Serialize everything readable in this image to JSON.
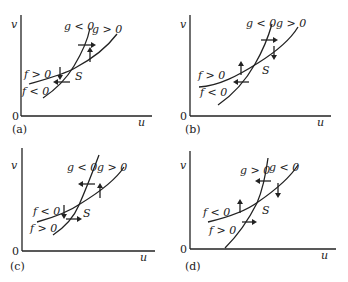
{
  "figure": {
    "panels": [
      {
        "id": "a",
        "caption": "(a)",
        "axis_x": "u",
        "axis_y": "v",
        "origin": "0",
        "f_upper": "f > 0",
        "f_lower": "f < 0",
        "g_left": "g < 0",
        "g_right": "g > 0",
        "point": "S"
      },
      {
        "id": "b",
        "caption": "(b)",
        "axis_x": "u",
        "axis_y": "v",
        "origin": "0",
        "f_upper": "f > 0",
        "f_lower": "f < 0",
        "g_left": "g < 0",
        "g_right": "g > 0",
        "point": "S"
      },
      {
        "id": "c",
        "caption": "(c)",
        "axis_x": "u",
        "axis_y": "v",
        "origin": "0",
        "f_upper": "f < 0",
        "f_lower": "f > 0",
        "g_left": "g < 0",
        "g_right": "g > 0",
        "point": "S"
      },
      {
        "id": "d",
        "caption": "(d)",
        "axis_x": "u",
        "axis_y": "v",
        "origin": "0",
        "f_upper": "f < 0",
        "f_lower": "f > 0",
        "g_left": "g > 0",
        "g_right": "g < 0",
        "point": "S"
      }
    ],
    "colors": {
      "ink": "#222222",
      "background": "#ffffff"
    }
  }
}
